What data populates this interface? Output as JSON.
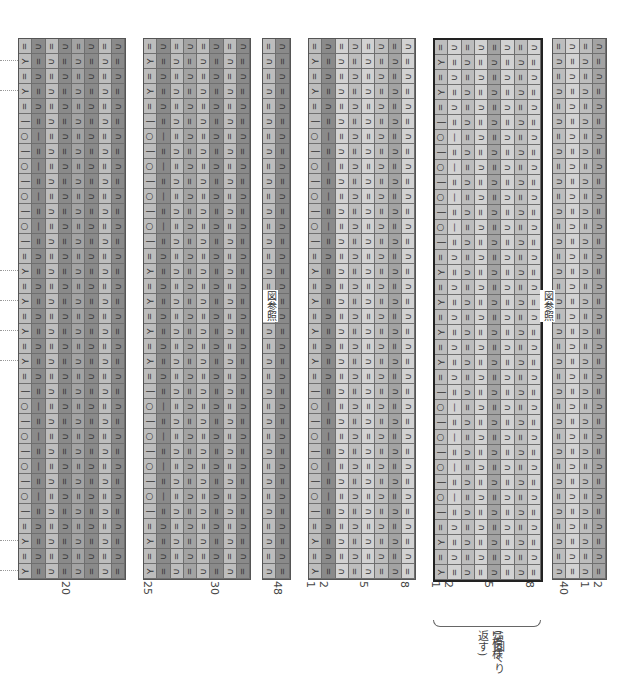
{
  "chart": {
    "rows": 36,
    "symbol_column": [
      "=",
      "Y",
      "=",
      "Y",
      "=",
      "-",
      "O",
      "-",
      "O",
      "-",
      "O",
      "-",
      "O",
      "-",
      "=",
      "λ",
      "=",
      "λ",
      "=",
      "Y",
      "=",
      "Y",
      "=",
      "-",
      "O",
      "-",
      "O",
      "-",
      "O",
      "-",
      "O",
      "-",
      "=",
      "λ",
      "=",
      "λ"
    ],
    "colors": {
      "pale": "#d2d2d2",
      "light": "#bdbdbd",
      "mid": "#a3a3a3",
      "dark": "#8a8a8a",
      "grid": "#6f6f6f"
    }
  },
  "blocks": [
    {
      "id": "A",
      "x": 18,
      "cols": 8,
      "shades": [
        "light",
        "dark",
        "light",
        "dark",
        "mid",
        "dark",
        "light",
        "dark"
      ],
      "bold": false
    },
    {
      "id": "B",
      "x": 143,
      "cols": 8,
      "shades": [
        "light",
        "dark",
        "light",
        "mid",
        "light",
        "dark",
        "light",
        "dark"
      ],
      "bold": false
    },
    {
      "id": "C",
      "x": 262,
      "cols": 2,
      "shades": [
        "light",
        "dark"
      ],
      "bold": false
    },
    {
      "id": "D",
      "x": 308,
      "cols": 8,
      "shades": [
        "light",
        "dark",
        "pale",
        "light",
        "pale",
        "light",
        "mid",
        "pale"
      ],
      "bold": false
    },
    {
      "id": "E",
      "x": 433,
      "cols": 8,
      "shades": [
        "light",
        "pale",
        "light",
        "pale",
        "mid",
        "pale",
        "light",
        "pale"
      ],
      "bold": true
    },
    {
      "id": "F",
      "x": 552,
      "cols": 4,
      "shades": [
        "light",
        "pale",
        "light",
        "mid"
      ],
      "bold": false
    }
  ],
  "column_numbers": [
    {
      "text": "20",
      "x": 66
    },
    {
      "text": "25",
      "x": 148
    },
    {
      "text": "30",
      "x": 215
    },
    {
      "text": "48",
      "x": 278
    },
    {
      "text": "1",
      "x": 311
    },
    {
      "text": "2",
      "x": 324
    },
    {
      "text": "5",
      "x": 364
    },
    {
      "text": "8",
      "x": 405
    },
    {
      "text": "1",
      "x": 436
    },
    {
      "text": "2",
      "x": 449
    },
    {
      "text": "5",
      "x": 489
    },
    {
      "text": "8",
      "x": 530
    },
    {
      "text": "40",
      "x": 564
    },
    {
      "text": "1",
      "x": 585
    },
    {
      "text": "2",
      "x": 598
    }
  ],
  "notes": {
    "see_figure_1": "図参照",
    "see_figure_2": "図参照",
    "repeat_label": "1模様",
    "repeat_count": "(5回くり返す)"
  }
}
